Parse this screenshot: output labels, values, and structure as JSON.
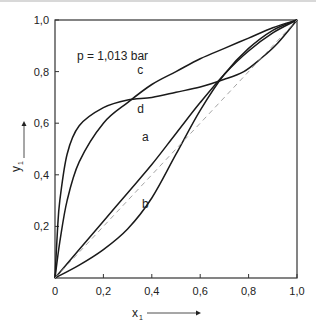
{
  "chart_data": {
    "type": "line",
    "title": "",
    "annotation": "p = 1,013 bar",
    "xlabel": "x",
    "xlabel_sub": "1",
    "ylabel": "y",
    "ylabel_sub": "1",
    "xlim": [
      0,
      1
    ],
    "ylim": [
      0,
      1
    ],
    "x_ticks": [
      "0",
      "0,2",
      "0,4",
      "0,6",
      "0,8",
      "1,0"
    ],
    "y_ticks": [
      "0,2",
      "0,4",
      "0,6",
      "0,8",
      "1,0"
    ],
    "grid": false,
    "legend": "inline curve labels",
    "series": [
      {
        "name": "a",
        "label_pos": [
          0.36,
          0.53
        ],
        "x": [
          0,
          0.1,
          0.2,
          0.3,
          0.4,
          0.5,
          0.6,
          0.7,
          0.8,
          0.9,
          1.0
        ],
        "y": [
          0,
          0.11,
          0.22,
          0.33,
          0.44,
          0.56,
          0.68,
          0.79,
          0.88,
          0.95,
          1.0
        ]
      },
      {
        "name": "b",
        "label_pos": [
          0.36,
          0.27
        ],
        "x": [
          0,
          0.1,
          0.2,
          0.3,
          0.4,
          0.5,
          0.6,
          0.7,
          0.8,
          0.9,
          1.0
        ],
        "y": [
          0,
          0.05,
          0.11,
          0.19,
          0.31,
          0.48,
          0.65,
          0.79,
          0.89,
          0.96,
          1.0
        ]
      },
      {
        "name": "c",
        "label_pos": [
          0.34,
          0.79
        ],
        "x": [
          0,
          0.02,
          0.05,
          0.1,
          0.2,
          0.3,
          0.4,
          0.5,
          0.6,
          0.7,
          0.8,
          0.9,
          1.0
        ],
        "y": [
          0,
          0.14,
          0.3,
          0.45,
          0.6,
          0.68,
          0.75,
          0.8,
          0.85,
          0.89,
          0.93,
          0.97,
          1.0
        ]
      },
      {
        "name": "d",
        "label_pos": [
          0.34,
          0.64
        ],
        "x": [
          0,
          0.01,
          0.02,
          0.05,
          0.1,
          0.2,
          0.3,
          0.4,
          0.5,
          0.6,
          0.7,
          0.78,
          0.85,
          0.92,
          1.0
        ],
        "y": [
          0,
          0.18,
          0.3,
          0.48,
          0.59,
          0.66,
          0.69,
          0.7,
          0.72,
          0.74,
          0.77,
          0.8,
          0.85,
          0.91,
          1.0
        ]
      },
      {
        "name": "diagonal",
        "style": "dashed",
        "x": [
          0,
          1
        ],
        "y": [
          0,
          1
        ]
      }
    ],
    "colors": {
      "curve": "#1a1a1a",
      "diagonal": "#9a9a9a",
      "axis": "#333333"
    }
  }
}
